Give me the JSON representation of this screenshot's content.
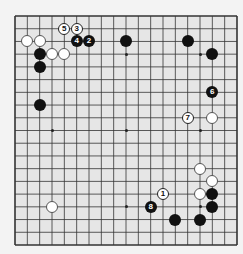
{
  "board": {
    "size": 19,
    "colors": {
      "background": "#e6e6e6",
      "line": "#333333",
      "black": "#111111",
      "white": "#ffffff"
    },
    "star_points": [
      [
        3,
        3
      ],
      [
        9,
        3
      ],
      [
        15,
        3
      ],
      [
        3,
        9
      ],
      [
        9,
        9
      ],
      [
        15,
        9
      ],
      [
        3,
        15
      ],
      [
        9,
        15
      ],
      [
        15,
        15
      ]
    ],
    "stones": [
      {
        "color": "white",
        "col": 1,
        "row": 2
      },
      {
        "color": "white",
        "col": 2,
        "row": 2
      },
      {
        "color": "white",
        "col": 3,
        "row": 3
      },
      {
        "color": "white",
        "col": 4,
        "row": 3
      },
      {
        "color": "white",
        "col": 3,
        "row": 15
      },
      {
        "color": "white",
        "col": 16,
        "row": 8
      },
      {
        "color": "white",
        "col": 15,
        "row": 12
      },
      {
        "color": "white",
        "col": 16,
        "row": 13
      },
      {
        "color": "white",
        "col": 15,
        "row": 14
      },
      {
        "color": "black",
        "col": 2,
        "row": 3
      },
      {
        "color": "black",
        "col": 2,
        "row": 4
      },
      {
        "color": "black",
        "col": 9,
        "row": 2
      },
      {
        "color": "black",
        "col": 14,
        "row": 2
      },
      {
        "color": "black",
        "col": 16,
        "row": 3
      },
      {
        "color": "black",
        "col": 2,
        "row": 7
      },
      {
        "color": "black",
        "col": 13,
        "row": 16
      },
      {
        "color": "black",
        "col": 15,
        "row": 16
      },
      {
        "color": "black",
        "col": 16,
        "row": 14
      },
      {
        "color": "black",
        "col": 16,
        "row": 15
      }
    ],
    "moves": [
      {
        "number": "1",
        "color": "white",
        "col": 12,
        "row": 14
      },
      {
        "number": "2",
        "color": "black",
        "col": 6,
        "row": 2
      },
      {
        "number": "3",
        "color": "white",
        "col": 5,
        "row": 1
      },
      {
        "number": "4",
        "color": "black",
        "col": 5,
        "row": 2
      },
      {
        "number": "5",
        "color": "white",
        "col": 4,
        "row": 1
      },
      {
        "number": "6",
        "color": "black",
        "col": 16,
        "row": 6
      },
      {
        "number": "7",
        "color": "white",
        "col": 14,
        "row": 8
      },
      {
        "number": "8",
        "color": "black",
        "col": 11,
        "row": 15
      }
    ]
  }
}
